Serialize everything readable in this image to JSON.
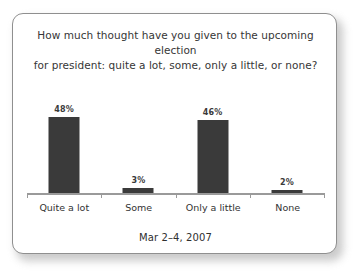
{
  "card": {
    "title_line1": "How much thought have you given to the upcoming election",
    "title_line2": "for president: quite a lot, some, only a little, or none?",
    "footer": "Mar 2–4, 2007"
  },
  "chart_data": {
    "type": "bar",
    "title": "How much thought have you given to the upcoming election for president: quite a lot, some, only a little, or none?",
    "subtitle": "Mar 2–4, 2007",
    "categories": [
      "Quite a lot",
      "Some",
      "Only a little",
      "None"
    ],
    "values": [
      48,
      3,
      46,
      2
    ],
    "value_labels": [
      "48%",
      "3%",
      "46%",
      "2%"
    ],
    "xlabel": "",
    "ylabel": "",
    "ylim": [
      0,
      60
    ],
    "grid": false,
    "legend": "none",
    "bar_color": "#3a3a3a",
    "axis_color": "#9a9a9a",
    "text_color": "#333333"
  }
}
